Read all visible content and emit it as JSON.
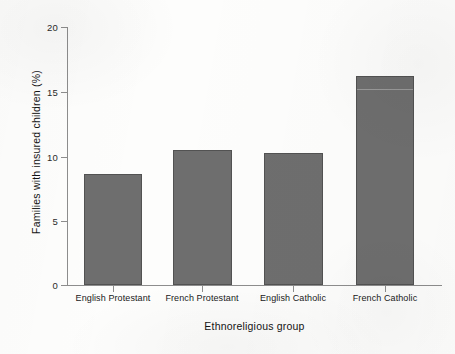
{
  "chart_data": {
    "type": "bar",
    "title": "",
    "xlabel": "Ethnoreligious group",
    "ylabel": "Families with insured children (%)",
    "categories": [
      "English Protestant",
      "French Protestant",
      "English Catholic",
      "French Catholic"
    ],
    "values": [
      8.6,
      10.5,
      10.2,
      16.2
    ],
    "ylim": [
      0,
      20
    ],
    "yticks": [
      0,
      5,
      10,
      15,
      20
    ],
    "ytick_labels": [
      "0",
      "5",
      "10",
      "15",
      "20"
    ],
    "grid": false,
    "legend": false,
    "legend_position": "none",
    "bar_color": "#6e6e6e",
    "bar_edge_color": "#525252",
    "axis_color": "#8d8d8d",
    "background_color": "#fdfdfc"
  }
}
